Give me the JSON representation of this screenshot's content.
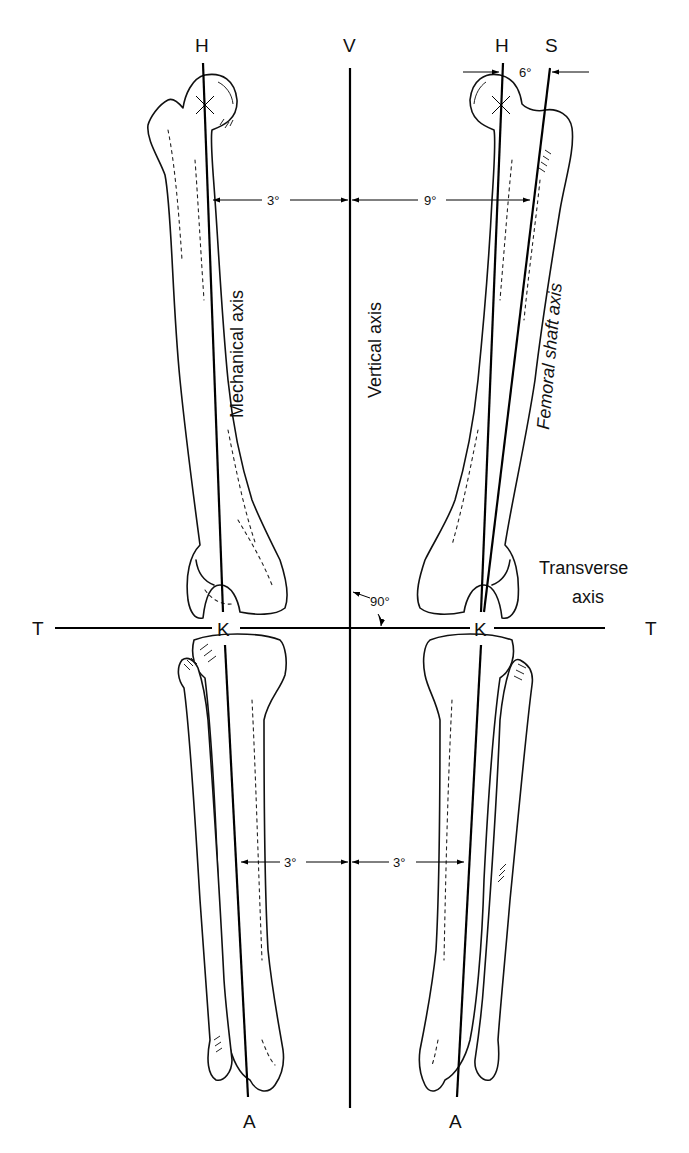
{
  "figure": {
    "width": 689,
    "height": 1153,
    "background": "#ffffff",
    "ink": "#000000"
  },
  "points": {
    "H_left": "H",
    "V": "V",
    "H_right": "H",
    "S": "S",
    "T_left": "T",
    "T_right": "T",
    "K_left": "K",
    "K_right": "K",
    "A_left": "A",
    "A_right": "A"
  },
  "axis_labels": {
    "mechanical": "Mechanical axis",
    "vertical": "Vertical axis",
    "femoral_shaft": "Femoral shaft axis",
    "transverse_line1": "Transverse",
    "transverse_line2": "axis"
  },
  "angles": {
    "mechanical_to_vertical_upper": "3°",
    "shaft_to_vertical_upper": "9°",
    "mechanical_to_shaft_head": "6°",
    "transverse_to_vertical": "90°",
    "left_tibia_to_vertical": "3°",
    "right_tibia_to_vertical": "3°"
  },
  "lines": {
    "vertical": {
      "x1": 350,
      "y1": 68,
      "x2": 350,
      "y2": 1108
    },
    "transverse": {
      "x1": 55,
      "y1": 628,
      "x2": 605,
      "y2": 628
    },
    "left_mech_upper": {
      "x1": 203,
      "y1": 63,
      "x2": 223,
      "y2": 612
    },
    "left_mech_lower": {
      "x1": 225,
      "y1": 645,
      "x2": 248,
      "y2": 1097
    },
    "right_mech_upper": {
      "x1": 503,
      "y1": 63,
      "x2": 481,
      "y2": 612
    },
    "right_mech_lower": {
      "x1": 481,
      "y1": 645,
      "x2": 457,
      "y2": 1097
    },
    "shaft": {
      "x1": 550,
      "y1": 68,
      "x2": 484,
      "y2": 612
    }
  }
}
